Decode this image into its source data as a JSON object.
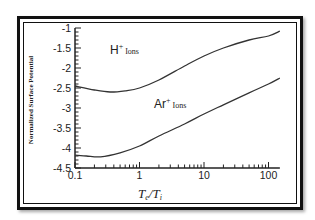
{
  "chart_data": {
    "type": "line",
    "title": "",
    "xlabel": "Te/Ti",
    "xlabel_parts": {
      "main1": "T",
      "sub1": "e",
      "slash": "/",
      "main2": "T",
      "sub2": "i"
    },
    "ylabel": "Normalized Surface Potential",
    "xscale": "log",
    "xlim": [
      0.1,
      150
    ],
    "ylim": [
      -4.5,
      -1
    ],
    "x_ticks": [
      "0.1",
      "1",
      "10",
      "100"
    ],
    "y_ticks": [
      "-1",
      "-1.5",
      "-2",
      "-2.5",
      "-3",
      "-3.5",
      "-4",
      "-4.5"
    ],
    "grid": false,
    "legend": "none (inline annotations)",
    "annotations": [
      {
        "text": "H+ Ions",
        "ion": "H",
        "sup": "+",
        "label": "Ions"
      },
      {
        "text": "Ar+ Ions",
        "ion": "Ar",
        "sup": "+",
        "label": "Ions"
      }
    ],
    "series": [
      {
        "name": "H+ Ions",
        "x": [
          0.1,
          0.2,
          0.35,
          0.6,
          1,
          2,
          5,
          10,
          20,
          50,
          100,
          150
        ],
        "y": [
          -2.45,
          -2.55,
          -2.6,
          -2.57,
          -2.5,
          -2.3,
          -1.95,
          -1.7,
          -1.5,
          -1.3,
          -1.2,
          -1.08
        ]
      },
      {
        "name": "Ar+ Ions",
        "x": [
          0.1,
          0.15,
          0.25,
          0.5,
          1,
          2,
          5,
          10,
          20,
          50,
          100,
          150
        ],
        "y": [
          -4.18,
          -4.2,
          -4.22,
          -4.12,
          -3.95,
          -3.7,
          -3.4,
          -3.15,
          -2.92,
          -2.62,
          -2.4,
          -2.25
        ]
      }
    ]
  }
}
